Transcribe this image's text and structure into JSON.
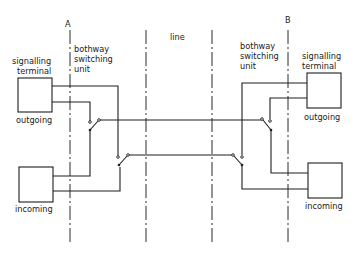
{
  "diagram": {
    "type": "circuit",
    "labels": {
      "point_a": "A",
      "point_b": "B",
      "line": "line",
      "left_unit_line1": "bothway",
      "left_unit_line2": "switching",
      "left_unit_line3": "unit",
      "right_unit_line1": "bothway",
      "right_unit_line2": "switching",
      "right_unit_line3": "unit",
      "left_terminal_line1": "signalling",
      "left_terminal_line2": "terminal",
      "right_terminal_line1": "signalling",
      "right_terminal_line2": "terminal",
      "left_outgoing": "outgoing",
      "left_incoming": "incoming",
      "right_outgoing": "outgoing",
      "right_incoming": "incoming"
    },
    "nodes": [
      {
        "id": "left-outgoing-terminal",
        "label": "outgoing"
      },
      {
        "id": "left-incoming-terminal",
        "label": "incoming"
      },
      {
        "id": "right-outgoing-terminal",
        "label": "outgoing"
      },
      {
        "id": "right-incoming-terminal",
        "label": "incoming"
      },
      {
        "id": "left-switch-1"
      },
      {
        "id": "left-switch-2"
      },
      {
        "id": "right-switch-1"
      },
      {
        "id": "right-switch-2"
      }
    ],
    "boundaries": [
      "A",
      "line-left",
      "line-right",
      "B"
    ]
  }
}
